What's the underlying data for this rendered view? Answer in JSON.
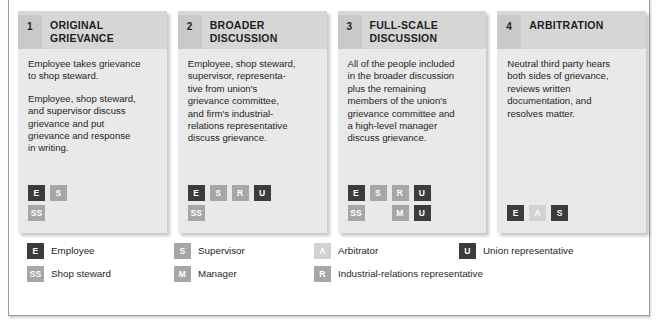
{
  "figure": {
    "colors": {
      "chip_dark": "#3c3c3c",
      "chip_mid": "#7d7d7d",
      "chip_light": "#a6a6a6",
      "chip_pale": "#d2d2d2",
      "card_bg": "#e9e9e9",
      "header_bg": "#d6d6d6",
      "number_bg": "#c9c9c9",
      "frame_border": "#9a9a9a"
    }
  },
  "cards": [
    {
      "number": "1",
      "title": "ORIGINAL\nGRIEVANCE",
      "paragraphs": [
        "Employee takes grievance\nto shop steward.",
        "Employee, shop steward,\nand supervisor discuss\ngrievance and put\ngrievance and response\nin writing."
      ],
      "chip_rows": [
        [
          {
            "label": "E",
            "tone": "dark"
          },
          {
            "label": "S",
            "tone": "light"
          }
        ],
        [
          {
            "label": "SS",
            "tone": "light"
          }
        ]
      ]
    },
    {
      "number": "2",
      "title": "BROADER\nDISCUSSION",
      "paragraphs": [
        "Employee, shop steward,\nsupervisor, representa-\ntive from union's\ngrievance committee,\nand firm's industrial-\nrelations representative\ndiscuss grievance."
      ],
      "chip_rows": [
        [
          {
            "label": "E",
            "tone": "dark"
          },
          {
            "label": "S",
            "tone": "light"
          },
          {
            "label": "R",
            "tone": "light"
          },
          {
            "label": "U",
            "tone": "dark"
          }
        ],
        [
          {
            "label": "SS",
            "tone": "light"
          }
        ]
      ]
    },
    {
      "number": "3",
      "title": "FULL-SCALE\nDISCUSSION",
      "paragraphs": [
        "All of the people included\nin the broader discussion\nplus the remaining\nmembers of the union's\ngrievance committee and\na high-level manager\ndiscuss grievance."
      ],
      "chip_rows": [
        [
          {
            "label": "E",
            "tone": "dark"
          },
          {
            "label": "S",
            "tone": "light"
          },
          {
            "label": "R",
            "tone": "light"
          },
          {
            "label": "U",
            "tone": "dark"
          }
        ],
        [
          {
            "label": "SS",
            "tone": "light"
          },
          {
            "label": "",
            "tone": "spacer"
          },
          {
            "label": "M",
            "tone": "light"
          },
          {
            "label": "U",
            "tone": "dark"
          }
        ]
      ]
    },
    {
      "number": "4",
      "title": "ARBITRATION",
      "paragraphs": [
        "Neutral third party hears\nboth sides of grievance,\nreviews written\ndocumentation, and\nresolves matter."
      ],
      "chip_rows": [
        [
          {
            "label": "E",
            "tone": "dark"
          },
          {
            "label": "A",
            "tone": "pale"
          },
          {
            "label": "S",
            "tone": "dark"
          }
        ]
      ]
    }
  ],
  "legend": {
    "row1": [
      {
        "label": "E",
        "tone": "dark",
        "text": "Employee"
      },
      {
        "label": "S",
        "tone": "light",
        "text": "Supervisor"
      },
      {
        "label": "A",
        "tone": "pale",
        "text": "Arbitrator"
      },
      {
        "label": "U",
        "tone": "dark",
        "text": "Union representative"
      }
    ],
    "row2": [
      {
        "label": "SS",
        "tone": "light",
        "text": "Shop steward"
      },
      {
        "label": "M",
        "tone": "light",
        "text": "Manager"
      },
      {
        "label": "R",
        "tone": "light",
        "text": "Industrial-relations representative"
      }
    ]
  }
}
